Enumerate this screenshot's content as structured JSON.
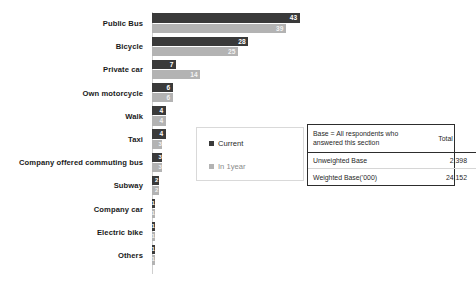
{
  "chart_data": {
    "type": "bar",
    "orientation": "horizontal",
    "title": "",
    "xlabel": "",
    "ylabel": "",
    "grid": false,
    "legend_position": "center",
    "xlim": [
      0,
      46
    ],
    "categories": [
      "Public Bus",
      "Bicycle",
      "Private car",
      "Own motorcycle",
      "Walk",
      "Taxi",
      "Company offered commuting bus",
      "Subway",
      "Company car",
      "Electric bike",
      "Others"
    ],
    "series": [
      {
        "name": "Current",
        "color": "#3a3a3a",
        "values": [
          43,
          28,
          7,
          6,
          4,
          4,
          3,
          2,
          1,
          1,
          1
        ]
      },
      {
        "name": "In 1year",
        "color": "#b3b3b3",
        "values": [
          39,
          25,
          14,
          6,
          4,
          3,
          3,
          2,
          1,
          1,
          1
        ]
      }
    ]
  },
  "legend": {
    "items": [
      {
        "label": "Current",
        "color": "#3a3a3a"
      },
      {
        "label": "In 1year",
        "color": "#b3b3b3"
      }
    ]
  },
  "base_table": {
    "header": {
      "description": "Base = All respondents who answered this section",
      "total_label": "Total"
    },
    "rows": [
      {
        "label": "Unweighted Base",
        "value": "2,398"
      },
      {
        "label": "Weighted Base('000)",
        "value": "24,152"
      }
    ]
  }
}
